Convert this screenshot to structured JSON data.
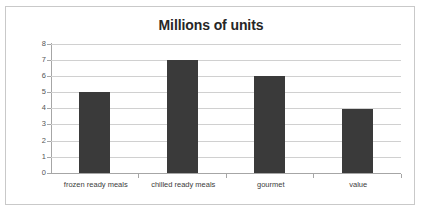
{
  "chart_data": {
    "type": "bar",
    "title": "Millions of units",
    "xlabel": "",
    "ylabel": "",
    "categories": [
      "frozen ready meals",
      "chilled ready meals",
      "gourmet",
      "value"
    ],
    "values": [
      5,
      7,
      6,
      4
    ],
    "ylim": [
      0,
      8
    ],
    "ytick_labels": [
      "8",
      "7",
      "6",
      "5",
      "4",
      "3",
      "2",
      "1",
      "0"
    ],
    "ytick_values": [
      8,
      7,
      6,
      5,
      4,
      3,
      2,
      1,
      0
    ],
    "grid": true,
    "legend": false,
    "bar_color": "#3a3a3a",
    "gridline_color": "#d0d0d0",
    "axis_color": "#a6a6a6",
    "plot_background": "#ffffff",
    "frame_border_color": "#c9c9c9"
  }
}
